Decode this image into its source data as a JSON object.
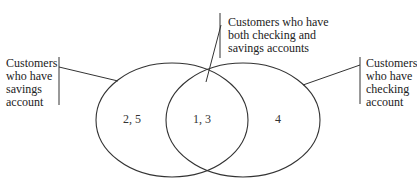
{
  "diagram": {
    "type": "venn",
    "sets": [
      {
        "name": "savings",
        "label_lines": [
          "Customers",
          "who have",
          "savings",
          "account"
        ],
        "only_region": "2, 5"
      },
      {
        "name": "checking",
        "label_lines": [
          "Customers",
          "who have",
          "checking",
          "account"
        ],
        "only_region": "4"
      }
    ],
    "intersection": {
      "label_lines": [
        "Customers who have",
        "both checking and",
        "savings accounts"
      ],
      "region": "1, 3"
    },
    "colors": {
      "stroke": "#333333",
      "text": "#222222",
      "background": "#ffffff"
    }
  }
}
